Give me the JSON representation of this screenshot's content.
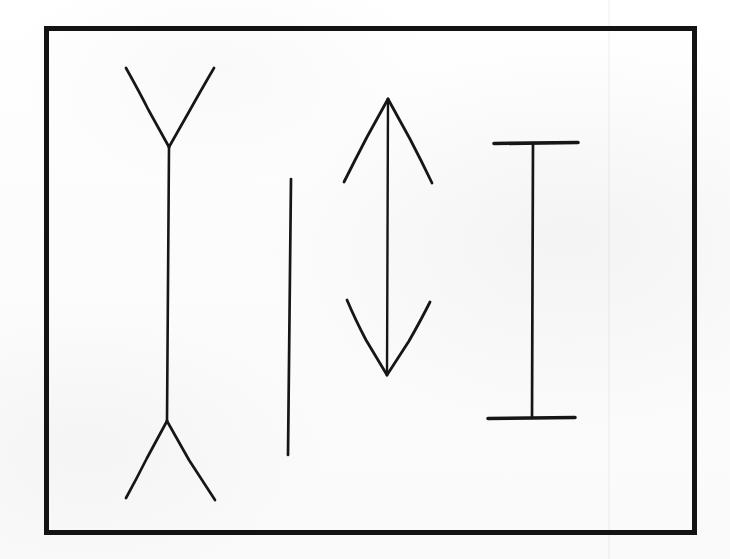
{
  "document": {
    "title": "Muller-Lyer Illusion Figures",
    "medium": "scanned-line-drawing",
    "ink_color": "#161616",
    "paper_color": "#fdfdfd",
    "canvas": {
      "width": 730,
      "height": 559
    }
  },
  "frame": {
    "label": "outer-rectangle-border",
    "x": 44,
    "y": 26,
    "width": 653,
    "height": 509,
    "stroke_width": 5,
    "color": "#131313"
  },
  "artifacts": {
    "scan_seam": {
      "label": "vertical-scan-seam",
      "x": 608,
      "visible": true
    }
  },
  "figures": [
    {
      "id": "figure-1",
      "name": "double-outward-fins-shaft",
      "description": "Vertical shaft with outward-spreading (Y-shaped) fins at both ends",
      "shaft": {
        "x1": 169,
        "y1": 147,
        "x2": 167,
        "y2": 421,
        "length": 274
      },
      "fins": [
        {
          "name": "top-left-fin",
          "x1": 169,
          "y1": 147,
          "x2": 126,
          "y2": 68
        },
        {
          "name": "top-right-fin",
          "x1": 169,
          "y1": 147,
          "x2": 214,
          "y2": 68
        },
        {
          "name": "bottom-left-fin",
          "x1": 167,
          "y1": 421,
          "x2": 126,
          "y2": 498
        },
        {
          "name": "bottom-right-fin",
          "x1": 167,
          "y1": 421,
          "x2": 215,
          "y2": 500
        }
      ],
      "stroke_width": 2.6
    },
    {
      "id": "figure-2",
      "name": "plain-vertical-line",
      "description": "Bare control line with no fins",
      "shaft": {
        "x1": 291,
        "y1": 179,
        "x2": 288,
        "y2": 455,
        "length": 276
      },
      "fins": [],
      "stroke_width": 2.6
    },
    {
      "id": "figure-3",
      "name": "double-headed-arrow",
      "description": "Vertical shaft with inward-pointing arrowheads at both ends",
      "shaft": {
        "x1": 388,
        "y1": 99,
        "x2": 387,
        "y2": 375,
        "length": 276
      },
      "fins": [
        {
          "name": "top-left-arrow-fin",
          "x1": 388,
          "y1": 99,
          "x2": 344,
          "y2": 182
        },
        {
          "name": "top-right-arrow-fin",
          "x1": 388,
          "y1": 99,
          "x2": 432,
          "y2": 183
        },
        {
          "name": "bottom-left-arrow-fin",
          "x1": 387,
          "y1": 375,
          "x2": 347,
          "y2": 300
        },
        {
          "name": "bottom-right-arrow-fin",
          "x1": 387,
          "y1": 375,
          "x2": 430,
          "y2": 302
        }
      ],
      "stroke_width": 2.6
    },
    {
      "id": "figure-4",
      "name": "i-beam-with-crossbars",
      "description": "Vertical shaft capped by perpendicular horizontal crossbars",
      "shaft": {
        "x1": 533,
        "y1": 143,
        "x2": 532,
        "y2": 418,
        "length": 275
      },
      "fins": [
        {
          "name": "top-crossbar",
          "x1": 494,
          "y1": 143,
          "x2": 578,
          "y2": 143
        },
        {
          "name": "bottom-crossbar",
          "x1": 488,
          "y1": 418,
          "x2": 575,
          "y2": 418
        }
      ],
      "stroke_width": 2.6,
      "crossbar_stroke_width": 3.6
    }
  ],
  "chart_data": {
    "type": "line",
    "title": "Muller-Lyer Illusion Figures",
    "xlabel": "",
    "ylabel": "",
    "categories": [
      "outward-fins",
      "plain-line",
      "inward-arrowheads",
      "crossbars"
    ],
    "series": [
      {
        "name": "shaft length (px)",
        "values": [
          274,
          276,
          276,
          275
        ]
      },
      {
        "name": "shaft center x (px)",
        "values": [
          168,
          290,
          388,
          533
        ]
      }
    ],
    "annotations": [
      "All four vertical shafts are drawn at essentially equal length",
      "Terminator style differs: outward fins, none, inward arrowheads, crossbars"
    ],
    "grid": false,
    "legend": "none"
  }
}
